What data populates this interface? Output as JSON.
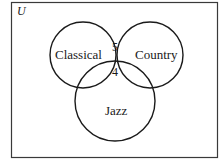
{
  "diagram": {
    "type": "venn",
    "universe_label": "U",
    "sets": [
      {
        "name": "Classical",
        "label": "Classical"
      },
      {
        "name": "Country",
        "label": "Country"
      },
      {
        "name": "Jazz",
        "label": "Jazz"
      }
    ],
    "regions": {
      "classical_and_country_only": "5",
      "all_three": "4"
    },
    "colors": {
      "stroke": "#1a1a1a",
      "background": "#ffffff"
    }
  }
}
